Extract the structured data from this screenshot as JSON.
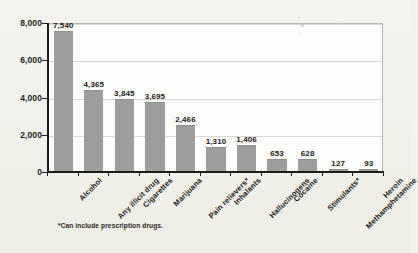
{
  "chart_data": {
    "type": "bar",
    "title": "",
    "xlabel": "",
    "ylabel": "",
    "ylim": [
      0,
      8000
    ],
    "grid": true,
    "legend": "none",
    "categories": [
      "Alcohol",
      "Any illicit drug",
      "Cigarettes",
      "Marijuana",
      "Pain relievers*",
      "Inhalants",
      "Hallucinogens",
      "Cocaine",
      "Stimulants*",
      "Methamphetamine",
      "Heroin"
    ],
    "values": [
      7540,
      4365,
      3845,
      3695,
      2466,
      1310,
      1406,
      653,
      628,
      127,
      93
    ],
    "value_labels": [
      "7,540",
      "4,365",
      "3,845",
      "3,695",
      "2,466",
      "1,310",
      "1,406",
      "653",
      "628",
      "127",
      "93"
    ],
    "yticks": [
      0,
      2000,
      4000,
      6000,
      8000
    ],
    "ytick_labels": [
      "0",
      "2,000",
      "4,000",
      "6,000",
      "8,000"
    ],
    "footnote": "*Can include prescription drugs.",
    "colors": {
      "bar_fill": "#9d9d9d",
      "axis": "#1d1d1b",
      "gridline": "#d9d9d4",
      "plot_background": "#fdfdfb",
      "page_background": "#f2f1ec",
      "text": "#1d1a18"
    }
  }
}
